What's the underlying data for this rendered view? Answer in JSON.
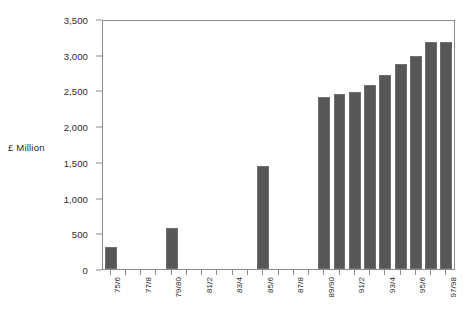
{
  "chart_data": {
    "type": "bar",
    "title": "",
    "xlabel": "",
    "ylabel": "£ Million",
    "ylim": [
      0,
      3500
    ],
    "ytick_values": [
      0,
      500,
      1000,
      1500,
      2000,
      2500,
      3000,
      3500
    ],
    "ytick_labels": [
      "0",
      "500",
      "1,000",
      "1,500",
      "2,000",
      "2,500",
      "3,000",
      "3,500"
    ],
    "grid": false,
    "legend": null,
    "bar_color": "#575757",
    "axis_color": "#8a8a8a",
    "categories": [
      "75/6",
      "76/7",
      "77/8",
      "78/9",
      "79/80",
      "80/1",
      "81/2",
      "82/3",
      "83/4",
      "84/5",
      "85/6",
      "86/7",
      "87/8",
      "88/9",
      "89/90",
      "90/1",
      "91/2",
      "92/3",
      "93/4",
      "94/5",
      "95/6",
      "96/7",
      "97/98"
    ],
    "xtick_labels_shown": [
      "75/6",
      "77/8",
      "79/80",
      "81/2",
      "83/4",
      "85/6",
      "87/8",
      "89/90",
      "91/2",
      "93/4",
      "95/6",
      "97/98"
    ],
    "values": [
      305,
      null,
      null,
      null,
      575,
      null,
      null,
      null,
      null,
      null,
      1450,
      null,
      null,
      null,
      2430,
      2475,
      2500,
      2600,
      2745,
      2900,
      3005,
      3200,
      3200
    ],
    "series": [
      {
        "name": "£ Million",
        "values": [
          305,
          0,
          0,
          0,
          575,
          0,
          0,
          0,
          0,
          0,
          1450,
          0,
          0,
          0,
          2430,
          2475,
          2500,
          2600,
          2745,
          2900,
          3005,
          3200,
          3200
        ]
      }
    ]
  }
}
